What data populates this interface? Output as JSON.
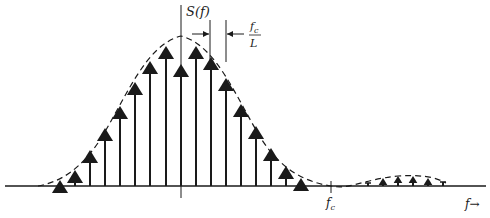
{
  "diagram": {
    "y_label": "S(f)",
    "spacing_label_num": "f",
    "spacing_label_num_sub": "c",
    "spacing_label_den": "L",
    "fc_label": "f",
    "fc_label_sub": "c",
    "x_label": "f→",
    "colors": {
      "ink": "#1a1a1a",
      "background": "#ffffff"
    },
    "baseline_y": 186,
    "center_x": 181,
    "fc_x": 331,
    "main_lobe_stems": [
      {
        "x": 60,
        "tip": 180
      },
      {
        "x": 75,
        "tip": 170
      },
      {
        "x": 90,
        "tip": 150
      },
      {
        "x": 105,
        "tip": 128
      },
      {
        "x": 120,
        "tip": 106
      },
      {
        "x": 135,
        "tip": 82
      },
      {
        "x": 150,
        "tip": 61
      },
      {
        "x": 166,
        "tip": 46
      },
      {
        "x": 181,
        "tip": 64
      },
      {
        "x": 196,
        "tip": 46
      },
      {
        "x": 211,
        "tip": 57
      },
      {
        "x": 226,
        "tip": 78
      },
      {
        "x": 241,
        "tip": 104
      },
      {
        "x": 256,
        "tip": 126
      },
      {
        "x": 271,
        "tip": 148
      },
      {
        "x": 286,
        "tip": 166
      },
      {
        "x": 301,
        "tip": 178
      }
    ],
    "side_lobe_stems": [
      {
        "x": 368,
        "tip": 183,
        "arrow": false
      },
      {
        "x": 383,
        "tip": 178,
        "arrow": true
      },
      {
        "x": 398,
        "tip": 176,
        "arrow": true
      },
      {
        "x": 413,
        "tip": 176,
        "arrow": true
      },
      {
        "x": 428,
        "tip": 178,
        "arrow": true
      },
      {
        "x": 443,
        "tip": 182,
        "arrow": false
      }
    ]
  }
}
